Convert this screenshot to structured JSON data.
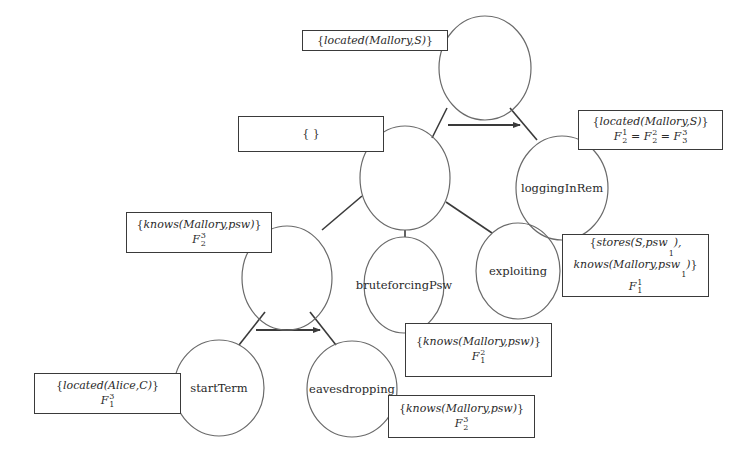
{
  "diagram": {
    "type": "attack-tree",
    "nodes": [
      {
        "id": "root",
        "label": "",
        "cx": 485,
        "cy": 68,
        "rx": 46,
        "ry": 52
      },
      {
        "id": "mid",
        "label": "",
        "cx": 405,
        "cy": 178,
        "rx": 45,
        "ry": 52
      },
      {
        "id": "loggingInRem",
        "label": "loggingInRem",
        "cx": 562,
        "cy": 188,
        "rx": 46,
        "ry": 52
      },
      {
        "id": "left",
        "label": "",
        "cx": 287,
        "cy": 278,
        "rx": 45,
        "ry": 52
      },
      {
        "id": "bruteforcingPsw",
        "label": "bruteforcingPsw",
        "cx": 404,
        "cy": 285,
        "rx": 40,
        "ry": 48
      },
      {
        "id": "exploiting",
        "label": "exploiting",
        "cx": 518,
        "cy": 271,
        "rx": 42,
        "ry": 48
      },
      {
        "id": "startTerm",
        "label": "startTerm",
        "cx": 219,
        "cy": 388,
        "rx": 45,
        "ry": 48
      },
      {
        "id": "eavesdropping",
        "label": "eavesdropping",
        "cx": 352,
        "cy": 389,
        "rx": 45,
        "ry": 48
      }
    ],
    "edges": [
      {
        "from": "root",
        "to": "mid",
        "x1": 447,
        "y1": 108,
        "x2": 432,
        "y2": 138
      },
      {
        "from": "root",
        "to": "loggingInRem",
        "x1": 510,
        "y1": 108,
        "x2": 537,
        "y2": 140
      },
      {
        "from": "mid",
        "to": "left",
        "x1": 362,
        "y1": 196,
        "x2": 322,
        "y2": 230
      },
      {
        "from": "mid",
        "to": "bruteforcingPsw",
        "x1": 405,
        "y1": 230,
        "x2": 405,
        "y2": 237
      },
      {
        "from": "mid",
        "to": "exploiting",
        "x1": 446,
        "y1": 202,
        "x2": 492,
        "y2": 233
      },
      {
        "from": "left",
        "to": "startTerm",
        "x1": 265,
        "y1": 312,
        "x2": 239,
        "y2": 345
      },
      {
        "from": "left",
        "to": "eavesdropping",
        "x1": 310,
        "y1": 312,
        "x2": 336,
        "y2": 345
      }
    ],
    "sequence_arrows": [
      {
        "x1": 448,
        "y1": 125,
        "x2": 520,
        "y2": 125
      },
      {
        "x1": 256,
        "y1": 330,
        "x2": 320,
        "y2": 330
      }
    ],
    "boxes": [
      {
        "id": "box-root",
        "x": 302,
        "y": 30,
        "w": 146,
        "h": 21,
        "lines": [
          [
            {
              "t": "{",
              "i": false
            },
            {
              "t": "located(Mallory,S)",
              "i": true
            },
            {
              "t": "}",
              "i": false
            }
          ]
        ]
      },
      {
        "id": "box-mid",
        "x": 238,
        "y": 116,
        "w": 146,
        "h": 36,
        "lines": [
          [
            {
              "t": "{ }",
              "i": false
            }
          ]
        ]
      },
      {
        "id": "box-logging",
        "x": 578,
        "y": 110,
        "w": 145,
        "h": 40,
        "lines": [
          [
            {
              "t": "{",
              "i": false
            },
            {
              "t": "located(Mallory,S)",
              "i": true
            },
            {
              "t": "}",
              "i": false
            }
          ],
          [
            {
              "t": "F",
              "i": true,
              "sup": "1",
              "sub": "2"
            },
            {
              "t": " = ",
              "i": false
            },
            {
              "t": "F",
              "i": true,
              "sup": "2",
              "sub": "2"
            },
            {
              "t": " = ",
              "i": false
            },
            {
              "t": "F",
              "i": true,
              "sup": "3",
              "sub": "3"
            }
          ]
        ]
      },
      {
        "id": "box-left",
        "x": 126,
        "y": 212,
        "w": 146,
        "h": 41,
        "lines": [
          [
            {
              "t": "{",
              "i": false
            },
            {
              "t": "knows(Mallory,psw)",
              "i": true
            },
            {
              "t": "}",
              "i": false
            }
          ],
          [
            {
              "t": "F",
              "i": true,
              "sup": "3",
              "sub": "2"
            }
          ]
        ]
      },
      {
        "id": "box-exploiting",
        "x": 562,
        "y": 234,
        "w": 147,
        "h": 63,
        "lines": [
          [
            {
              "t": "{",
              "i": false
            },
            {
              "t": "stores(S,psw",
              "i": true
            },
            {
              "t": "",
              "i": true,
              "sub": "1"
            },
            {
              "t": "),",
              "i": true
            }
          ],
          [
            {
              "t": "knows(Mallory,psw",
              "i": true
            },
            {
              "t": "",
              "i": true,
              "sub": "1"
            },
            {
              "t": ")",
              "i": true
            },
            {
              "t": "}",
              "i": false
            }
          ],
          [
            {
              "t": "F",
              "i": true,
              "sup": "1",
              "sub": "1"
            }
          ]
        ]
      },
      {
        "id": "box-brute",
        "x": 405,
        "y": 323,
        "w": 147,
        "h": 54,
        "lines": [
          [
            {
              "t": "{",
              "i": false
            },
            {
              "t": "knows(Mallory,psw)",
              "i": true
            },
            {
              "t": "}",
              "i": false
            }
          ],
          [
            {
              "t": "F",
              "i": true,
              "sup": "2",
              "sub": "1"
            }
          ]
        ]
      },
      {
        "id": "box-start",
        "x": 34,
        "y": 373,
        "w": 147,
        "h": 41,
        "lines": [
          [
            {
              "t": "{",
              "i": false
            },
            {
              "t": "located(Alice,C)",
              "i": true
            },
            {
              "t": "}",
              "i": false
            }
          ],
          [
            {
              "t": "F",
              "i": true,
              "sup": "3",
              "sub": "1"
            }
          ]
        ]
      },
      {
        "id": "box-eaves",
        "x": 388,
        "y": 395,
        "w": 147,
        "h": 43,
        "lines": [
          [
            {
              "t": "{",
              "i": false
            },
            {
              "t": "knows(Mallory,psw)",
              "i": true
            },
            {
              "t": "}",
              "i": false
            }
          ],
          [
            {
              "t": "F",
              "i": true,
              "sup": "3",
              "sub": "2"
            }
          ]
        ]
      }
    ],
    "colors": {
      "stroke": "#3a3a3a",
      "node_stroke": "#6a6a6a",
      "text": "#2a2a2a",
      "background": "#ffffff"
    }
  }
}
